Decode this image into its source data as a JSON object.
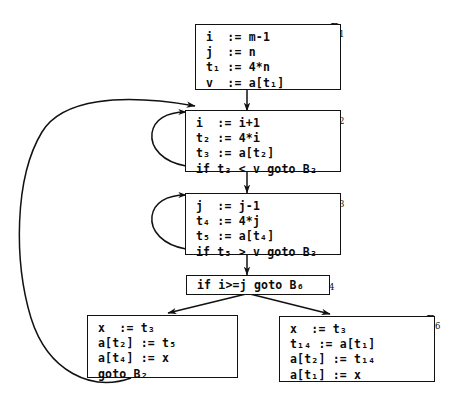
{
  "diagram": {
    "type": "control-flow-graph",
    "title": "",
    "stroke_color": "#111111",
    "background_color": "#ffffff",
    "blocks": [
      {
        "id": "B1",
        "label": "B",
        "label_sub": "1",
        "label_position": "top-right",
        "statements": [
          "i  := m-1",
          "j  := n",
          "t₁ := 4*n",
          "v  := a[t₁]"
        ]
      },
      {
        "id": "B2",
        "label": "B",
        "label_sub": "2",
        "label_position": "top-right",
        "statements": [
          "i  := i+1",
          "t₂ := 4*i",
          "t₃ := a[t₂]",
          "if t₃ < v goto B₂"
        ]
      },
      {
        "id": "B3",
        "label": "B",
        "label_sub": "3",
        "label_position": "top-right",
        "statements": [
          "j  := j-1",
          "t₄ := 4*j",
          "t₅ := a[t₄]",
          "if t₅ > v goto B₃"
        ]
      },
      {
        "id": "B4",
        "label": "B",
        "label_sub": "4",
        "label_position": "top-right",
        "statements": [
          "if i>=j goto B₆"
        ]
      },
      {
        "id": "B5",
        "label": "B",
        "label_sub": "5",
        "label_position": "top-left",
        "statements": [
          "x  := t₃",
          "a[t₂] := t₅",
          "a[t₄] := x",
          "goto B₂"
        ]
      },
      {
        "id": "B6",
        "label": "B",
        "label_sub": "6",
        "label_position": "top-right",
        "statements": [
          "x  := t₃",
          "t₁₄ := a[t₁]",
          "a[t₂] := t₁₄",
          "a[t₁] := x"
        ]
      }
    ],
    "edges": [
      {
        "from": "B1",
        "to": "B2",
        "kind": "straight-down"
      },
      {
        "from": "B2",
        "to": "B2",
        "kind": "self-loop-left"
      },
      {
        "from": "B2",
        "to": "B3",
        "kind": "straight-down"
      },
      {
        "from": "B3",
        "to": "B3",
        "kind": "self-loop-left"
      },
      {
        "from": "B3",
        "to": "B4",
        "kind": "straight-down"
      },
      {
        "from": "B4",
        "to": "B5",
        "kind": "branch-diagonal-left"
      },
      {
        "from": "B4",
        "to": "B6",
        "kind": "branch-diagonal-right"
      },
      {
        "from": "B5",
        "to": "B2",
        "kind": "back-edge-around-left"
      }
    ]
  }
}
